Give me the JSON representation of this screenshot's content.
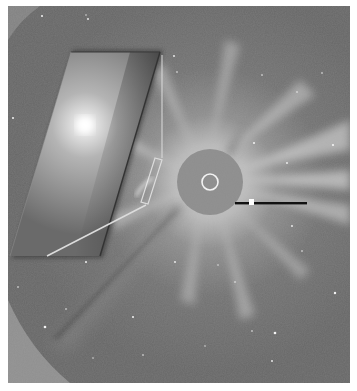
{
  "image": {
    "kind": "coronagraph-composite",
    "width": 357,
    "height": 391,
    "frame": {
      "x": 8,
      "y": 6,
      "width": 342,
      "height": 377
    },
    "colors": {
      "sky": "#6e6e6e",
      "sky_dark": "#5e5e5e",
      "outer_field_edge": "#8a8a8a",
      "occulter": "#8e8e8e",
      "sun_ring": "#f2f2f2",
      "pylon": "#111111",
      "inset_bright": "#ffffff",
      "inset_base": "#8c8c8c",
      "overlay_line": "#d8d8d8"
    },
    "occulter": {
      "cx": 210,
      "cy": 182,
      "r": 33,
      "sun_ring_r": 8
    },
    "pylon": {
      "x1": 235,
      "y1": 203,
      "x2": 307,
      "y2": 203,
      "marker_x": 251
    },
    "inset": {
      "shape": "parallelogram",
      "points": [
        [
          71,
          52
        ],
        [
          160,
          52
        ],
        [
          100,
          256
        ],
        [
          10,
          256
        ]
      ],
      "bright_center": {
        "x": 85,
        "y": 125
      }
    },
    "overlay_lines": {
      "vertical": {
        "x": 162,
        "y1": 55,
        "y2": 158
      },
      "diagonal": {
        "x1": 47,
        "y1": 256,
        "x2": 146,
        "y2": 205
      },
      "small_box": [
        [
          155,
          158
        ],
        [
          162,
          160
        ],
        [
          148,
          204
        ],
        [
          141,
          202
        ]
      ]
    },
    "streak": {
      "from": [
        185,
        208
      ],
      "to": [
        45,
        345
      ]
    }
  }
}
